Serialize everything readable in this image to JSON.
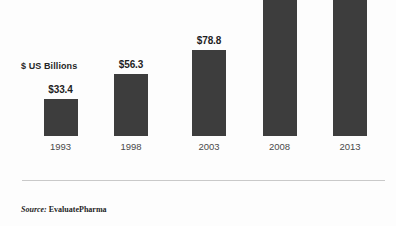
{
  "chart_data": {
    "type": "bar",
    "title": "",
    "subtitle": "",
    "xlabel": "",
    "ylabel": "$ US Billions",
    "categories": [
      "1993",
      "1998",
      "2003",
      "2008",
      "2013"
    ],
    "values": [
      33.4,
      56.3,
      78.8,
      129.2,
      137.5
    ],
    "data_labels": [
      "$33.4",
      "$56.3",
      "$78.8",
      "$129.2",
      "$137.5"
    ],
    "series": [
      {
        "name": "Global pharmaceutical sales",
        "values": [
          33.4,
          56.3,
          78.8,
          129.2,
          137.5
        ]
      }
    ],
    "ylim": [
      0,
      166
    ],
    "grid": false,
    "legend": "none",
    "bar_color": "#3d3d3d",
    "axis_color": "#c9c9c9",
    "background_color": "#fdfdfd"
  },
  "axis_caption": "$ US Billions",
  "source": {
    "label": "Source:",
    "value": "EvaluatePharma"
  }
}
